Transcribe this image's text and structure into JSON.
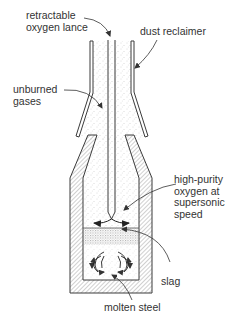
{
  "diagram": {
    "labels": {
      "lance": "retractable\noxygen lance",
      "dust": "dust reclaimer",
      "gases": "unburned\ngases",
      "oxygen": "high-purity\noxygen at\nsupersonic\nspeed",
      "slag": "slag",
      "steel": "molten steel"
    },
    "colors": {
      "line": "#3a3a3a",
      "hatch": "#8a8a8a",
      "stipple": "#b5b5b5",
      "background": "#ffffff"
    }
  }
}
